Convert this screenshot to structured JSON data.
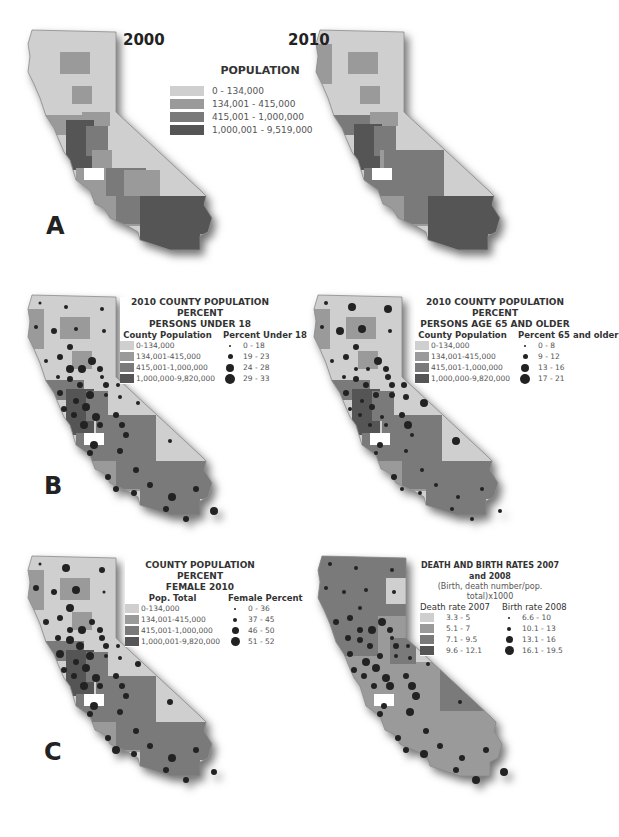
{
  "figure": {
    "panels": {
      "A": {
        "label": "A"
      },
      "B": {
        "label": "B"
      },
      "C": {
        "label": "C"
      }
    },
    "palette": {
      "class1": "#cfcfcf",
      "class2": "#9a9a9a",
      "class3": "#7a7a7a",
      "class4": "#555555",
      "dot": "#222222",
      "border": "#ffffff"
    },
    "map_2000": {
      "year": "2000",
      "legend": {
        "title": "POPULATION",
        "classes": [
          "0 - 134,000",
          "134,001 - 415,000",
          "415,001 - 1,000,000",
          "1,000,001 - 9,519,000"
        ]
      }
    },
    "map_2010": {
      "year": "2010"
    },
    "map_under18": {
      "legend": {
        "title_line1": "2010 COUNTY POPULATION PERCENT",
        "title_line2": "PERSONS UNDER 18",
        "fill_header": "County Population",
        "dot_header": "Percent Under 18",
        "fill_classes": [
          "0-134,000",
          "134,001-415,000",
          "415,001-1,000,000",
          "1,000,000-9,820,000"
        ],
        "dot_classes": [
          "0 - 18",
          "19 - 23",
          "24 - 28",
          "29 - 33"
        ]
      }
    },
    "map_65older": {
      "legend": {
        "title_line1": "2010 COUNTY POPULATION PERCENT",
        "title_line2": "PERSONS AGE 65 AND OLDER",
        "fill_header": "County Population",
        "dot_header": "Percent 65 and older",
        "fill_classes": [
          "0-134,000",
          "134,001-415,000",
          "415,001-1,000,000",
          "1,000,000-9,820,000"
        ],
        "dot_classes": [
          "0 - 8",
          "9 - 12",
          "13 - 16",
          "17 - 21"
        ]
      }
    },
    "map_female": {
      "legend": {
        "title_line1": "COUNTY POPULATION PERCENT",
        "title_line2": "FEMALE 2010",
        "fill_header": "Pop. Total",
        "dot_header": "Female Percent",
        "fill_classes": [
          "0-134,000",
          "134,001-415,000",
          "415,001-1,000,000",
          "1,000,001-9,820,000"
        ],
        "dot_classes": [
          "0 - 36",
          "37 - 45",
          "46 - 50",
          "51 - 52"
        ]
      }
    },
    "map_rates": {
      "legend": {
        "title_line1": "DEATH AND BIRTH RATES 2007 and 2008",
        "subtitle": "(Birth, death number/pop. total)x1000",
        "fill_header": "Death rate 2007",
        "dot_header": "Birth rate 2008",
        "fill_classes": [
          "3.3 - 5",
          "5.1 - 7",
          "7.1 - 9.5",
          "9.6 - 12.1"
        ],
        "dot_classes": [
          "6.6 - 10",
          "10.1 - 13",
          "13.1 - 16",
          "16.1 - 19.5"
        ]
      }
    }
  }
}
